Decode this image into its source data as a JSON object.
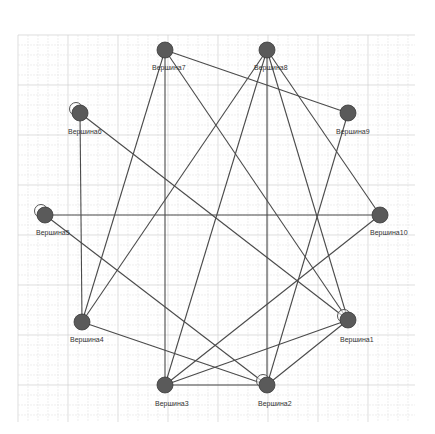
{
  "graph": {
    "grid": {
      "x0": 18,
      "y0": 35,
      "x1": 415,
      "y1": 422,
      "minor": 10,
      "major": 50,
      "minor_color": "#e6e6e6",
      "major_color": "#d0d0d0"
    },
    "colors": {
      "edge": "#4a4a4a",
      "node_fill": "#5a5a5a",
      "node_stroke": "#3a3a3a",
      "loop": "#555555"
    },
    "node_radius": 8,
    "nodes": [
      {
        "id": "n1",
        "label": "Вершина1",
        "x": 348,
        "y": 320,
        "lx": 340,
        "ly": 342,
        "loop": true
      },
      {
        "id": "n2",
        "label": "Вершина2",
        "x": 267,
        "y": 385,
        "lx": 258,
        "ly": 406,
        "loop": true
      },
      {
        "id": "n3",
        "label": "Вершина3",
        "x": 165,
        "y": 385,
        "lx": 155,
        "ly": 406,
        "loop": false
      },
      {
        "id": "n4",
        "label": "Вершина4",
        "x": 82,
        "y": 322,
        "lx": 70,
        "ly": 342,
        "loop": false
      },
      {
        "id": "n5",
        "label": "Вершина5",
        "x": 45,
        "y": 215,
        "lx": 36,
        "ly": 235,
        "loop": true
      },
      {
        "id": "n6",
        "label": "Вершина6",
        "x": 80,
        "y": 113,
        "lx": 68,
        "ly": 134,
        "loop": true
      },
      {
        "id": "n7",
        "label": "Вершина7",
        "x": 165,
        "y": 50,
        "lx": 152,
        "ly": 70,
        "loop": false
      },
      {
        "id": "n8",
        "label": "Вершина8",
        "x": 267,
        "y": 50,
        "lx": 254,
        "ly": 70,
        "loop": false
      },
      {
        "id": "n9",
        "label": "Вершина9",
        "x": 348,
        "y": 113,
        "lx": 336,
        "ly": 134,
        "loop": false
      },
      {
        "id": "n10",
        "label": "Вершина10",
        "x": 380,
        "y": 215,
        "lx": 370,
        "ly": 235,
        "loop": false
      }
    ],
    "edges": [
      [
        "n7",
        "n9"
      ],
      [
        "n7",
        "n3"
      ],
      [
        "n7",
        "n4"
      ],
      [
        "n7",
        "n1"
      ],
      [
        "n8",
        "n4"
      ],
      [
        "n8",
        "n2"
      ],
      [
        "n8",
        "n1"
      ],
      [
        "n8",
        "n10"
      ],
      [
        "n8",
        "n3"
      ],
      [
        "n9",
        "n2"
      ],
      [
        "n6",
        "n4"
      ],
      [
        "n6",
        "n1"
      ],
      [
        "n5",
        "n10"
      ],
      [
        "n5",
        "n2"
      ],
      [
        "n10",
        "n3"
      ],
      [
        "n4",
        "n2"
      ],
      [
        "n3",
        "n2"
      ],
      [
        "n3",
        "n1"
      ],
      [
        "n2",
        "n1"
      ]
    ]
  }
}
